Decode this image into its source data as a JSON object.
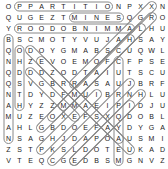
{
  "puzzle": {
    "cols": 15,
    "rows": 15,
    "cell_w": 11.0,
    "cell_h": 11.0,
    "origin_x": 2,
    "origin_y": 1,
    "grid": [
      "OPPARTITIONPXXHYFNN",
      "QUGEZTMINESQGRWXNO",
      "YKRODOBNIMMALHTGLQU",
      "BSCMOTYVUJAHSAZMZRY",
      "QODOYGMABSCUQWVXROL",
      "NHZEVOEMOFCFPSCMNVE",
      "QDDDZODTAIUTSCANLU",
      "QSVGBRRASAUJBRKVF",
      "NTDYDFMUIBRNHLU",
      "AHYZZMMAEIPIDJU",
      "MUZEOXEFSXQDOBL",
      "AHLGBDOEFAYDYGA",
      "NSAGHJDAPOAUSMSI",
      "ZSTPKSLDOTEUKAD",
      "VPDKQWWLAPGVTQEDCW"
    ],
    "rows_clean": [
      [
        "O",
        "P",
        "P",
        "A",
        "R",
        "T",
        "I",
        "T",
        "I",
        "O",
        "N",
        "P",
        "X",
        "X",
        "H",
        "Y",
        "F",
        "N",
        "N"
      ],
      [
        "Q",
        "U",
        "G",
        "E",
        "Z",
        "T",
        "M",
        "I",
        "N",
        "E",
        "S",
        "Q",
        "G",
        "R",
        "W",
        "X",
        "N",
        "O"
      ],
      [
        "Y",
        "K",
        "R",
        "O",
        "O",
        "D",
        "O",
        "B",
        "N",
        "I",
        "M",
        "M",
        "A",
        "L",
        "H",
        "T",
        "G",
        "L",
        "Q",
        "U"
      ],
      [
        "B",
        "S",
        "C",
        "M",
        "O",
        "T",
        "Y",
        "V",
        "U",
        "J",
        "A",
        "H",
        "S",
        "A",
        "Z",
        "M",
        "Z",
        "R",
        "Y"
      ],
      [
        "Q",
        "O",
        "D",
        "O",
        "Y",
        "G",
        "M",
        "A",
        "B",
        "S",
        "C",
        "U",
        "Q",
        "W",
        "V",
        "X",
        "R",
        "O",
        "L"
      ]
    ],
    "line_color": "#888888",
    "text_color": "#222222",
    "background": "#ffffff"
  },
  "display_rows": [
    "O P P A R T I T I O N P X X H Y F N N",
    "Q U G E Z T M I N E S Q G R W X N O",
    "Y K R O O D O B N I M M A L H T G L Q U",
    "B S C M O T Y V U J A H S A Z M Z R Y",
    "Q O D O Y G M A B S C U Q W V X R O L",
    "N H Z E V O E M O F C F P S C M N V E",
    "Q D D D Z O D T A I U T S C A N L U",
    "Q S V G B R R A S A U J B R K V F",
    "N T D Y D F M U I B R N H L U",
    "A H Y Z Z M M A E I P I D J U",
    "M U Z E O X E F S X Q D O B L",
    "A H L G B D O E F A Y D Y G A",
    "N S A G H J D A P O A U S M S I",
    "Z S T P K S L D O T E U K A D",
    "V P D K Q W W L A P G V T Q E D C W",
    "E Z D E T T A T A N N D Q N Y",
    "Z X O N O W R J S K N C O M K J",
    "R Y A C E Z F U P L Q G O Y F O N L",
    "S R R K A C E D Y W A I J J M O R G",
    "V T E Q C G E D B S M G N R V U E V Z B"
  ],
  "grid15": [
    [
      "O",
      "P",
      "P",
      "A",
      "R",
      "T",
      "I",
      "T",
      "I",
      "O",
      "N",
      "P",
      "X",
      "X",
      "N"
    ],
    [
      "Q",
      "U",
      "G",
      "E",
      "Z",
      "T",
      "M",
      "I",
      "N",
      "E",
      "S",
      "Q",
      "G",
      "R",
      "O"
    ],
    [
      "Y",
      "R",
      "O",
      "O",
      "D",
      "O",
      "B",
      "N",
      "I",
      "M",
      "M",
      "A",
      "L",
      "H",
      "U"
    ],
    [
      "B",
      "S",
      "C",
      "M",
      "O",
      "T",
      "Y",
      "V",
      "U",
      "J",
      "A",
      "H",
      "S",
      "A",
      "Y"
    ],
    [
      "Q",
      "O",
      "D",
      "O",
      "Y",
      "G",
      "M",
      "A",
      "B",
      "S",
      "C",
      "U",
      "Q",
      "W",
      "L"
    ],
    [
      "N",
      "H",
      "Z",
      "E",
      "V",
      "O",
      "E",
      "M",
      "O",
      "F",
      "C",
      "F",
      "P",
      "S",
      "E"
    ],
    [
      "Q",
      "D",
      "D",
      "D",
      "Z",
      "O",
      "D",
      "T",
      "A",
      "I",
      "U",
      "T",
      "S",
      "C",
      "U"
    ],
    [
      "Q",
      "S",
      "V",
      "G",
      "B",
      "R",
      "R",
      "A",
      "S",
      "A",
      "U",
      "J",
      "B",
      "R",
      "F"
    ],
    [
      "N",
      "T",
      "D",
      "Y",
      "D",
      "F",
      "M",
      "U",
      "I",
      "B",
      "R",
      "N",
      "H",
      "L",
      "U"
    ],
    [
      "A",
      "H",
      "Y",
      "Z",
      "Z",
      "M",
      "M",
      "A",
      "E",
      "I",
      "P",
      "I",
      "D",
      "J",
      "U"
    ],
    [
      "M",
      "U",
      "Z",
      "E",
      "O",
      "X",
      "E",
      "F",
      "S",
      "X",
      "Q",
      "D",
      "O",
      "B",
      "L"
    ],
    [
      "A",
      "H",
      "L",
      "G",
      "B",
      "D",
      "O",
      "E",
      "F",
      "A",
      "Y",
      "D",
      "Y",
      "G",
      "A"
    ],
    [
      "N",
      "S",
      "A",
      "G",
      "H",
      "J",
      "D",
      "A",
      "P",
      "O",
      "A",
      "U",
      "S",
      "M",
      "I"
    ],
    [
      "Z",
      "S",
      "T",
      "P",
      "K",
      "S",
      "L",
      "D",
      "O",
      "T",
      "E",
      "U",
      "K",
      "A",
      "D"
    ],
    [
      "V",
      "T",
      "E",
      "Q",
      "C",
      "G",
      "E",
      "D",
      "B",
      "S",
      "M",
      "G",
      "N",
      "V",
      "Z"
    ]
  ],
  "highlights": [
    {
      "word": "PARTITION",
      "from": [
        0,
        1
      ],
      "to": [
        0,
        9
      ]
    },
    {
      "word": "MINES",
      "from": [
        1,
        6
      ],
      "to": [
        1,
        10
      ]
    },
    {
      "word": "RODOBNIMMAL",
      "from": [
        2,
        1
      ],
      "to": [
        2,
        11
      ]
    }
  ]
}
